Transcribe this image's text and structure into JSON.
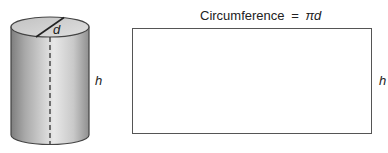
{
  "cylinder": {
    "diameter_label": "d",
    "height_label": "h"
  },
  "net_rectangle": {
    "top_label_text": "Circumference",
    "top_label_equals": "=",
    "top_label_formula_pi": "π",
    "top_label_formula_var": "d",
    "side_label": "h"
  },
  "colors": {
    "outline": "#555555",
    "cylinder_light": "#e6e6e6",
    "cylinder_dark": "#8a8a8a",
    "top_face": "#d4d4d4"
  }
}
